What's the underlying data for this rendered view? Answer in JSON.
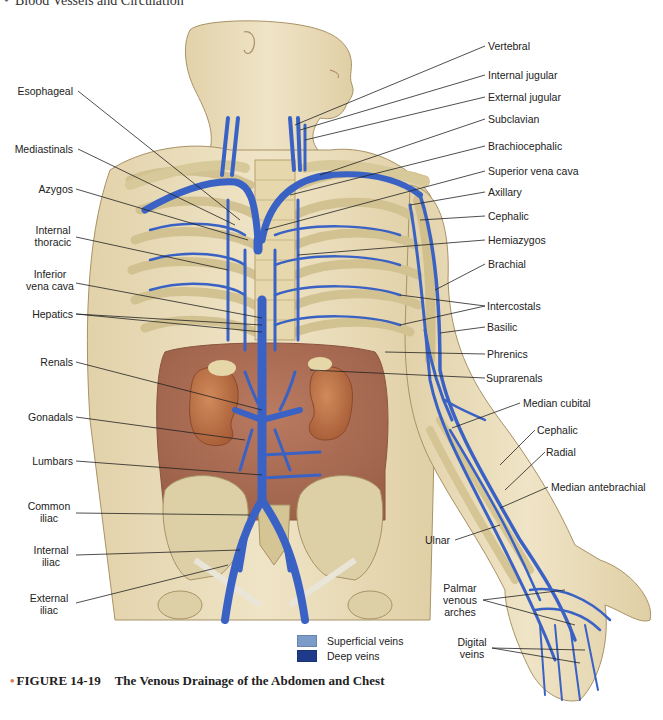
{
  "header": {
    "title": "Blood Vessels and Circulation"
  },
  "figure": {
    "number": "FIGURE 14-19",
    "title": "The Venous Drainage of the Abdomen and Chest",
    "bullet_color": "#e07a55"
  },
  "legend": {
    "items": [
      {
        "label": "Superficial veins",
        "color": "#7b9cc9"
      },
      {
        "label": "Deep veins",
        "color": "#1f3a8a"
      }
    ]
  },
  "colors": {
    "skin": "#e9dcb8",
    "bone": "#d8c99a",
    "cavity": "#a86a52",
    "kidney": "#b9683f",
    "vein": "#3a62c4",
    "leader_line": "#222222"
  },
  "labels": {
    "left": [
      {
        "id": "esophageal",
        "text": "Esophageal"
      },
      {
        "id": "mediastinals",
        "text": "Mediastinals"
      },
      {
        "id": "azygos",
        "text": "Azygos"
      },
      {
        "id": "internal-thoracic",
        "line1": "Internal",
        "line2": "thoracic"
      },
      {
        "id": "inferior-vena-cava",
        "line1": "Inferior",
        "line2": "vena cava"
      },
      {
        "id": "hepatics",
        "text": "Hepatics"
      },
      {
        "id": "renals",
        "text": "Renals"
      },
      {
        "id": "gonadals",
        "text": "Gonadals"
      },
      {
        "id": "lumbars",
        "text": "Lumbars"
      },
      {
        "id": "common-iliac",
        "line1": "Common",
        "line2": "iliac"
      },
      {
        "id": "internal-iliac",
        "line1": "Internal",
        "line2": "iliac"
      },
      {
        "id": "external-iliac",
        "line1": "External",
        "line2": "iliac"
      }
    ],
    "right": [
      {
        "id": "vertebral",
        "text": "Vertebral"
      },
      {
        "id": "internal-jugular",
        "text": "Internal jugular"
      },
      {
        "id": "external-jugular",
        "text": "External jugular"
      },
      {
        "id": "subclavian",
        "text": "Subclavian"
      },
      {
        "id": "brachiocephalic",
        "text": "Brachiocephalic"
      },
      {
        "id": "superior-vena-cava",
        "text": "Superior vena cava"
      },
      {
        "id": "axillary",
        "text": "Axillary"
      },
      {
        "id": "cephalic-upper",
        "text": "Cephalic"
      },
      {
        "id": "hemiazygos",
        "text": "Hemiazygos"
      },
      {
        "id": "brachial",
        "text": "Brachial"
      },
      {
        "id": "intercostals",
        "text": "Intercostals"
      },
      {
        "id": "basilic",
        "text": "Basilic"
      },
      {
        "id": "phrenics",
        "text": "Phrenics"
      },
      {
        "id": "suprarenals",
        "text": "Suprarenals"
      },
      {
        "id": "median-cubital",
        "text": "Median cubital"
      },
      {
        "id": "cephalic-lower",
        "text": "Cephalic"
      },
      {
        "id": "radial",
        "text": "Radial"
      },
      {
        "id": "median-antebrachial",
        "text": "Median antebrachial"
      },
      {
        "id": "ulnar",
        "text": "Ulnar"
      },
      {
        "id": "palmar-venous-arches",
        "line1": "Palmar",
        "line2": "venous",
        "line3": "arches"
      },
      {
        "id": "digital-veins",
        "line1": "Digital",
        "line2": "veins"
      }
    ]
  }
}
